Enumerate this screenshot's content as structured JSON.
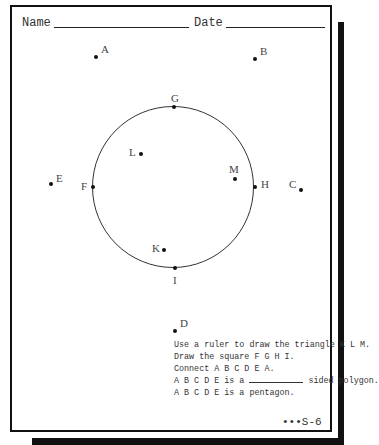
{
  "header": {
    "name_label": "Name",
    "date_label": "Date"
  },
  "points": {
    "A": "A",
    "B": "B",
    "C": "C",
    "D": "D",
    "E": "E",
    "F": "F",
    "G": "G",
    "H": "H",
    "I": "I",
    "K": "K",
    "L": "L",
    "M": "M"
  },
  "instructions": [
    "Use a ruler to draw the triangle K L M.",
    "Draw the square F G H I.",
    "Connect A B C D E A.",
    "A B C D E is a",
    "sided polygon.",
    "A B C D E is a pentagon."
  ],
  "page_code": "•••S-6"
}
